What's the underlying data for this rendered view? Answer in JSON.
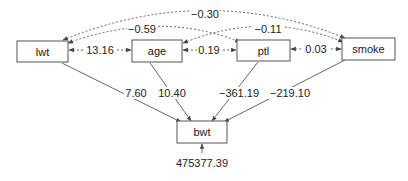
{
  "diagram": {
    "type": "path-diagram",
    "nodes": {
      "lwt": {
        "label": "lwt"
      },
      "age": {
        "label": "age"
      },
      "ptl": {
        "label": "ptl"
      },
      "smoke": {
        "label": "smoke"
      },
      "bwt": {
        "label": "bwt"
      }
    },
    "paths": [
      {
        "from": "lwt",
        "to": "bwt",
        "coef": "7.60"
      },
      {
        "from": "age",
        "to": "bwt",
        "coef": "10.40"
      },
      {
        "from": "ptl",
        "to": "bwt",
        "coef": "−361.19"
      },
      {
        "from": "smoke",
        "to": "bwt",
        "coef": "−219.10"
      }
    ],
    "covariances": [
      {
        "between": [
          "lwt",
          "smoke"
        ],
        "value": "−0.30"
      },
      {
        "between": [
          "lwt",
          "ptl"
        ],
        "value": "−0.59"
      },
      {
        "between": [
          "age",
          "smoke"
        ],
        "value": "−0.11"
      },
      {
        "between": [
          "lwt",
          "age"
        ],
        "value": "13.16"
      },
      {
        "between": [
          "age",
          "ptl"
        ],
        "value": "0.19"
      },
      {
        "between": [
          "ptl",
          "smoke"
        ],
        "value": "0.03"
      }
    ],
    "error": {
      "target": "bwt",
      "variance": "475377.39"
    },
    "colors": {
      "line": "#555555",
      "text": "#222222",
      "box_fill": "#ffffff"
    }
  }
}
